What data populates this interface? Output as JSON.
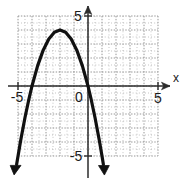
{
  "chart_data": {
    "type": "line",
    "title": "",
    "subtitle": "",
    "xlabel": "x",
    "ylabel": "",
    "grid": true,
    "legend": false,
    "legend_position": "none",
    "xlim": [
      -5.8,
      5.2
    ],
    "ylim": [
      -5.8,
      5.2
    ],
    "xticks": [
      -5,
      0,
      5
    ],
    "yticks": [
      5,
      -5
    ],
    "xticklabels": [
      "-5",
      "0",
      "5"
    ],
    "yticklabels": [
      "5",
      "-5"
    ],
    "origin_label": "0",
    "axis_arrow_x": true,
    "axis_arrow_y": true,
    "grid_xrange": [
      -5,
      5
    ],
    "grid_yrange": [
      -5,
      5
    ],
    "grid_step": 1,
    "series": [
      {
        "name": "parabola",
        "equation": "y = -(x+2)^2 + 4",
        "vertex": [
          -2,
          4
        ],
        "roots": [
          -4,
          0
        ],
        "opens": "down",
        "color": "#111111",
        "linewidth": 3.2,
        "arrow_start": true,
        "arrow_end": true,
        "x": [
          -5.1,
          -4.8,
          -4.5,
          -4.2,
          -4.0,
          -3.6,
          -3.2,
          -2.8,
          -2.4,
          -2.0,
          -1.6,
          -1.2,
          -0.8,
          -0.4,
          0.0,
          0.2,
          0.5,
          0.8,
          1.0,
          1.1
        ],
        "y": [
          -5.6,
          -3.84,
          -2.25,
          -0.84,
          0.0,
          1.44,
          2.56,
          3.36,
          3.84,
          4.0,
          3.84,
          3.36,
          2.56,
          1.44,
          0.0,
          -0.84,
          -2.25,
          -3.84,
          -5.0,
          -5.61
        ]
      }
    ],
    "colors": {
      "curve": "#111111",
      "axis": "#2b2b2b",
      "grid": "#8a8a8a",
      "label": "#1a1a1a",
      "background": "#ffffff"
    }
  }
}
